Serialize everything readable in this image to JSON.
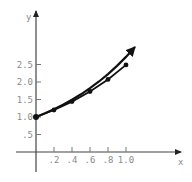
{
  "chart_data": {
    "type": "line",
    "title": "",
    "xlabel": "x",
    "ylabel": "y",
    "xlim": [
      0,
      1.6
    ],
    "ylim": [
      0,
      4.0
    ],
    "grid": false,
    "legend": null,
    "x_ticks": [
      0.2,
      0.4,
      0.6,
      0.8,
      1.0
    ],
    "x_tick_labels": [
      ".2",
      ".4",
      ".6",
      ".8",
      "1.0"
    ],
    "y_ticks": [
      0.5,
      1.0,
      1.5,
      2.0,
      2.5
    ],
    "y_tick_labels": [
      ".5",
      "1.0",
      "1.5",
      "2.0",
      "2.5"
    ],
    "series": [
      {
        "name": "exact curve y = e^x",
        "style": "smooth curve with arrowhead",
        "x": [
          0,
          0.1,
          0.2,
          0.3,
          0.4,
          0.5,
          0.6,
          0.7,
          0.8,
          0.9,
          1.0,
          1.1
        ],
        "values": [
          1.0,
          1.105,
          1.221,
          1.35,
          1.492,
          1.649,
          1.822,
          2.014,
          2.226,
          2.46,
          2.718,
          3.004
        ]
      },
      {
        "name": "approximation (Euler, h = 0.2)",
        "style": "polyline with dot markers",
        "x": [
          0,
          0.2,
          0.4,
          0.6,
          0.8,
          1.0
        ],
        "values": [
          1.0,
          1.2,
          1.44,
          1.728,
          2.074,
          2.488
        ]
      }
    ],
    "colors": {
      "axis": "#555555",
      "curve": "#111111",
      "label": "#8a8a8a"
    }
  }
}
